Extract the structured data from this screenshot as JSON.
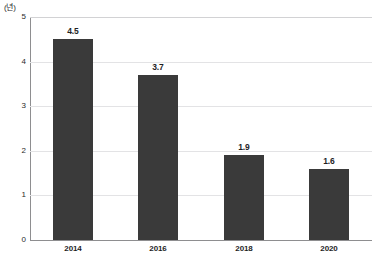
{
  "chart_data": {
    "type": "bar",
    "title": "",
    "subtitle": "",
    "xlabel": "",
    "ylabel": "",
    "unit_label": "(년)",
    "categories": [
      "2014",
      "2016",
      "2018",
      "2020"
    ],
    "values": [
      4.5,
      3.7,
      1.9,
      1.6
    ],
    "value_labels": [
      "4.5",
      "3.7",
      "1.9",
      "1.6"
    ],
    "series": [
      {
        "name": "",
        "values": [
          4.5,
          3.7,
          1.9,
          1.6
        ]
      }
    ],
    "ylim": [
      0,
      5
    ],
    "ytick_labels": [
      "0",
      "1",
      "2",
      "3",
      "4",
      "5"
    ],
    "ytick_values": [
      0,
      1,
      2,
      3,
      4,
      5
    ],
    "grid": true,
    "grid_axis": "y",
    "legend": false,
    "legend_position": "none",
    "bar_color": "#3a3a3a",
    "gridline_color": "#e3e3e5",
    "axis_color": "#8e8e90",
    "background_color": "#ffffff",
    "text_color": "#1f1f1f"
  }
}
